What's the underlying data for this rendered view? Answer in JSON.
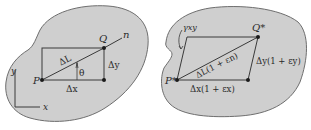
{
  "colors": {
    "background": "#ffffff",
    "body_fill": "#cfcfcf",
    "outline": "#6e6e6e",
    "line": "#3a3a3a",
    "text": "#2a2a2a"
  },
  "left_figure": {
    "description": "Undeformed body with line element PQ",
    "point_P": "P",
    "point_Q": "Q",
    "direction": "n",
    "length_label": "ΔL",
    "angle_label": "θ",
    "dx_label": "Δx",
    "dy_label": "Δy",
    "axis_x": "x",
    "axis_y": "y"
  },
  "right_figure": {
    "description": "Deformed body with line element P*Q*",
    "point_P": "P*",
    "point_Q": "Q*",
    "shear_label": "γxy",
    "length_label": "ΔL(1 + εn)",
    "dx_label": "Δx(1 + εx)",
    "dy_label": "Δy(1 + εy)"
  }
}
